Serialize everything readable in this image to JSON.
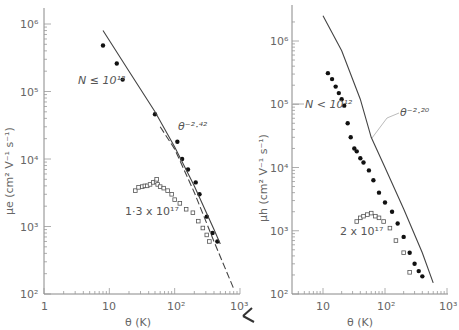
{
  "chart_data": [
    {
      "type": "scatter",
      "panel": "left",
      "title": "",
      "xlabel": "θ (K)",
      "ylabel": "μe (cm² V⁻¹ s⁻¹)",
      "xscale": "log",
      "yscale": "log",
      "xlim": [
        1,
        1000
      ],
      "ylim": [
        100,
        1000000
      ],
      "x_ticks": [
        "1",
        "10",
        "10²",
        "10³"
      ],
      "y_ticks": [
        "10²",
        "10³",
        "10⁴",
        "10⁵",
        "10⁶"
      ],
      "grid": false,
      "series": [
        {
          "name": "N ≤ 10¹²",
          "marker": "filled-circle",
          "x": [
            8,
            13,
            16,
            50,
            110,
            130,
            160,
            210,
            240,
            310,
            380,
            450
          ],
          "y": [
            480000,
            260000,
            150000,
            46000,
            18000,
            10000,
            7000,
            4500,
            3000,
            1400,
            800,
            600
          ]
        },
        {
          "name": "1·3 x 10¹⁷",
          "marker": "hollow-square",
          "x": [
            25,
            28,
            32,
            35,
            38,
            42,
            47,
            52,
            53,
            55,
            60,
            68,
            78,
            90,
            100,
            120,
            150,
            190,
            230,
            270,
            310,
            340
          ],
          "y": [
            3400,
            3800,
            3900,
            4000,
            4000,
            4200,
            4500,
            4600,
            5000,
            4200,
            3900,
            3700,
            3400,
            3000,
            2500,
            2200,
            1800,
            1600,
            1200,
            950,
            750,
            600
          ]
        },
        {
          "name": "theory",
          "line": "solid",
          "x": [
            8,
            20,
            50,
            100,
            200,
            400,
            500
          ],
          "y": [
            800000,
            200000,
            50000,
            15000,
            4000,
            900,
            550
          ]
        },
        {
          "name": "θ^-2.42",
          "line": "dashed",
          "x": [
            60,
            100,
            200,
            400,
            800
          ],
          "y": [
            30000,
            14000,
            3200,
            600,
            120
          ]
        }
      ],
      "annotations": [
        "N ≤ 10¹²",
        "θ^-2.42",
        "1·3 x 10¹⁷"
      ]
    },
    {
      "type": "scatter",
      "panel": "right",
      "title": "",
      "xlabel": "θ (K)",
      "ylabel": "μh (cm² V⁻¹ s⁻¹)",
      "xscale": "log",
      "yscale": "log",
      "xlim": [
        3.2,
        1000
      ],
      "ylim": [
        100,
        3000000
      ],
      "x_ticks": [
        "10",
        "10²",
        "10³"
      ],
      "y_ticks": [
        "10²",
        "10³",
        "10⁴",
        "10⁵",
        "10⁶"
      ],
      "grid": false,
      "series": [
        {
          "name": "N < 10¹²",
          "marker": "filled-circle",
          "x": [
            12,
            14,
            16,
            18,
            20,
            22,
            25,
            28,
            32,
            35,
            40,
            45,
            55,
            65,
            80,
            100,
            130,
            160,
            200,
            250,
            300,
            350,
            400
          ],
          "y": [
            310000,
            250000,
            190000,
            150000,
            120000,
            95000,
            50000,
            30000,
            20000,
            18000,
            14000,
            12000,
            9000,
            6300,
            4000,
            2800,
            2000,
            1300,
            800,
            450,
            300,
            230,
            190
          ]
        },
        {
          "name": "2 x 10¹⁷",
          "marker": "hollow-square",
          "x": [
            35,
            40,
            45,
            52,
            60,
            70,
            80,
            95,
            120,
            150,
            200,
            250
          ],
          "y": [
            1400,
            1600,
            1700,
            1800,
            1900,
            1700,
            1600,
            1400,
            1100,
            700,
            450,
            220
          ]
        },
        {
          "name": "theory",
          "line": "solid",
          "x": [
            10,
            20,
            40,
            60,
            100,
            200,
            400,
            600
          ],
          "y": [
            2500000,
            700000,
            120000,
            30000,
            10000,
            2200,
            450,
            150
          ]
        }
      ],
      "annotations": [
        "N < 10¹²",
        "θ^-2.20",
        "2 x 10¹⁷"
      ]
    }
  ],
  "left": {
    "ylabel": "μe  (cm² V⁻¹ s⁻¹)",
    "xlabel": "θ  (K)",
    "annot_n": "N ≤ 10¹²",
    "annot_pow": "θ⁻²·⁴²",
    "annot_conc": "1·3 x 10¹⁷",
    "xticks": [
      "1",
      "10",
      "10²",
      "10³"
    ],
    "yticks": [
      "10²",
      "10³",
      "10⁴",
      "10⁵",
      "10⁶"
    ]
  },
  "right": {
    "ylabel": "μh  (cm² V⁻¹ s⁻¹)",
    "xlabel": "θ  (K)",
    "annot_n": "N < 10¹²",
    "annot_pow": "θ⁻²·²⁰",
    "annot_conc": "2 x 10¹⁷",
    "xticks": [
      "10",
      "10²",
      "10³"
    ],
    "yticks": [
      "10²",
      "10³",
      "10⁴",
      "10⁵",
      "10⁶"
    ]
  }
}
